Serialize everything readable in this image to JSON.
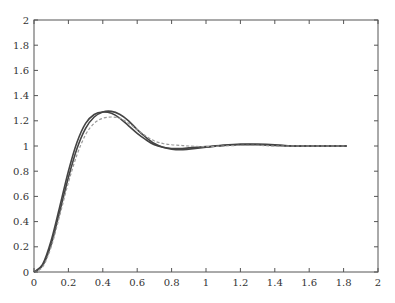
{
  "chart_data": {
    "type": "line",
    "title": "",
    "xlabel": "",
    "ylabel": "",
    "xlim": [
      0,
      2
    ],
    "ylim": [
      0,
      2
    ],
    "grid": false,
    "legend": null,
    "x_ticks": [
      "0",
      "0.2",
      "0.4",
      "0.6",
      "0.8",
      "1",
      "1.2",
      "1.4",
      "1.6",
      "1.8",
      "2"
    ],
    "y_ticks": [
      "0",
      "0.2",
      "0.4",
      "0.6",
      "0.8",
      "1",
      "1.2",
      "1.4",
      "1.6",
      "1.8",
      "2"
    ],
    "series": [
      {
        "name": "response-1",
        "style": "solid",
        "color": "#444444",
        "x": [
          0,
          0.05,
          0.1,
          0.15,
          0.2,
          0.25,
          0.3,
          0.35,
          0.4,
          0.45,
          0.5,
          0.55,
          0.6,
          0.65,
          0.7,
          0.75,
          0.8,
          0.85,
          0.9,
          1.0,
          1.1,
          1.2,
          1.3,
          1.4,
          1.5,
          1.6,
          1.7,
          1.82
        ],
        "y": [
          0,
          0.06,
          0.25,
          0.52,
          0.8,
          1.03,
          1.18,
          1.25,
          1.27,
          1.26,
          1.22,
          1.16,
          1.1,
          1.05,
          1.01,
          0.99,
          0.98,
          0.98,
          0.985,
          0.995,
          1.005,
          1.01,
          1.01,
          1.005,
          1.0,
          1.0,
          1.0,
          1.0
        ]
      },
      {
        "name": "response-2",
        "style": "solid",
        "color": "#444444",
        "x": [
          0,
          0.05,
          0.1,
          0.15,
          0.2,
          0.25,
          0.3,
          0.35,
          0.4,
          0.45,
          0.5,
          0.55,
          0.6,
          0.65,
          0.7,
          0.75,
          0.8,
          0.85,
          0.9,
          1.0,
          1.1,
          1.2,
          1.3,
          1.4,
          1.5,
          1.6,
          1.7,
          1.82
        ],
        "y": [
          0,
          0.05,
          0.22,
          0.48,
          0.75,
          0.98,
          1.14,
          1.23,
          1.27,
          1.275,
          1.25,
          1.2,
          1.13,
          1.07,
          1.02,
          0.99,
          0.975,
          0.97,
          0.975,
          0.99,
          1.005,
          1.015,
          1.015,
          1.01,
          1.0,
          1.0,
          1.0,
          1.0
        ]
      },
      {
        "name": "response-3",
        "style": "dashed",
        "color": "#999999",
        "x": [
          0,
          0.05,
          0.1,
          0.15,
          0.2,
          0.25,
          0.3,
          0.35,
          0.4,
          0.45,
          0.5,
          0.55,
          0.6,
          0.65,
          0.7,
          0.75,
          0.8,
          0.85,
          0.9,
          1.0,
          1.1,
          1.2,
          1.3,
          1.4,
          1.5,
          1.6,
          1.7,
          1.82
        ],
        "y": [
          0,
          0.04,
          0.2,
          0.45,
          0.71,
          0.93,
          1.09,
          1.18,
          1.22,
          1.23,
          1.22,
          1.18,
          1.13,
          1.08,
          1.04,
          1.02,
          1.01,
          1.005,
          1.0,
          0.995,
          1.0,
          1.005,
          1.005,
          1.0,
          1.0,
          1.0,
          1.0,
          1.0
        ]
      }
    ]
  },
  "axes": {
    "frame_color": "#555555",
    "plot_area_px": {
      "left": 34,
      "top": 20,
      "right": 378,
      "bottom": 272
    }
  }
}
